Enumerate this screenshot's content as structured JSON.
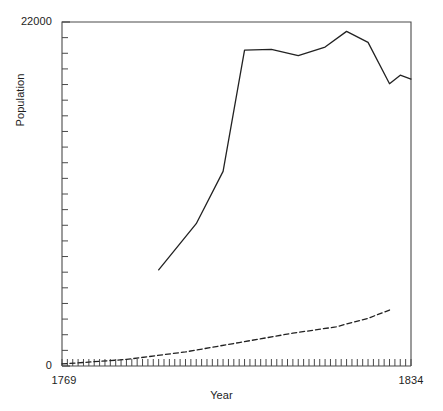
{
  "chart_data": {
    "type": "line",
    "title": "",
    "xlabel": "Year",
    "ylabel": "Population",
    "xlim": [
      1769,
      1834
    ],
    "ylim": [
      0,
      22000
    ],
    "ytick_labels": [
      "22000",
      "0"
    ],
    "xtick_labels": [
      "1769",
      "1834"
    ],
    "yticks_minor_step": 1000,
    "xticks_minor_step": 1,
    "grid": false,
    "legend": "none",
    "x": [
      1769,
      1834
    ],
    "series": [
      {
        "name": "upper-series",
        "style": "solid",
        "color": "#222222",
        "x": [
          1787,
          1794,
          1799,
          1803,
          1808,
          1813,
          1818,
          1822,
          1826,
          1830,
          1832,
          1834
        ],
        "values": [
          6150,
          9100,
          12450,
          20200,
          20250,
          19850,
          20400,
          21400,
          20700,
          18050,
          18600,
          18350
        ]
      },
      {
        "name": "lower-series",
        "style": "dashed",
        "color": "#222222",
        "x": [
          1769,
          1781,
          1792,
          1802,
          1812,
          1820,
          1826,
          1830
        ],
        "values": [
          130,
          420,
          900,
          1500,
          2100,
          2500,
          3050,
          3580
        ]
      }
    ]
  },
  "axes": {
    "plot_box": {
      "left": 62,
      "top": 22,
      "right": 411,
      "bottom": 366
    },
    "frame_color": "#4a4a4a"
  }
}
